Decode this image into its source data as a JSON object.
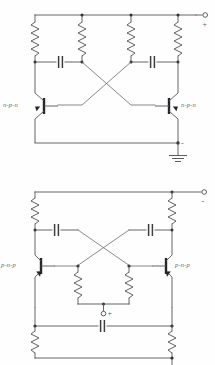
{
  "figure": {
    "kind": "schematic-diagram",
    "background_color": "#fefefe",
    "line_color": "#55565a",
    "node_color": "#2f3034"
  },
  "circuits": [
    {
      "id": "top-circuit",
      "name": "npn-cross-coupled-multivibrator",
      "transistors": [
        {
          "id": "q1",
          "label": "n-p-n",
          "side": "left"
        },
        {
          "id": "q2",
          "label": "n-p-n",
          "side": "right"
        }
      ],
      "resistors": [
        {
          "id": "r1",
          "position": "far-left"
        },
        {
          "id": "r2",
          "position": "left-center"
        },
        {
          "id": "r3",
          "position": "right-center"
        },
        {
          "id": "r4",
          "position": "far-right"
        }
      ],
      "capacitors": [
        {
          "id": "c1",
          "position": "left"
        },
        {
          "id": "c2",
          "position": "right"
        }
      ],
      "terminals": [
        {
          "id": "supply-positive",
          "icon": "open-terminal-circle",
          "sign": "+"
        },
        {
          "id": "ground-negative",
          "icon": "ground-icon",
          "sign": "-"
        }
      ]
    },
    {
      "id": "bottom-circuit",
      "name": "pnp-cross-coupled-multivibrator",
      "transistors": [
        {
          "id": "q3",
          "label": "p-n-p",
          "side": "left"
        },
        {
          "id": "q4",
          "label": "p-n-p",
          "side": "right"
        }
      ],
      "resistors": [
        {
          "id": "r5",
          "position": "upper-left"
        },
        {
          "id": "r6",
          "position": "upper-right"
        },
        {
          "id": "r7",
          "position": "mid-left"
        },
        {
          "id": "r8",
          "position": "mid-right"
        },
        {
          "id": "r9",
          "position": "lower-left"
        },
        {
          "id": "r10",
          "position": "lower-right"
        }
      ],
      "capacitors": [
        {
          "id": "c3",
          "position": "upper-left"
        },
        {
          "id": "c4",
          "position": "upper-right"
        },
        {
          "id": "c5",
          "position": "bottom-center"
        }
      ],
      "terminals": [
        {
          "id": "supply-negative",
          "icon": "open-terminal-circle",
          "sign": "-"
        },
        {
          "id": "bias-positive",
          "icon": "open-terminal-circle",
          "sign": "+"
        }
      ]
    }
  ],
  "labels": {
    "npn_left": "n-p-n",
    "npn_right": "n-p-n",
    "pnp_left": "p-n-p",
    "pnp_right": "p-n-p",
    "plus_top": "+",
    "minus_top": "-",
    "minus_bottom": "-",
    "plus_bottom": "+"
  }
}
